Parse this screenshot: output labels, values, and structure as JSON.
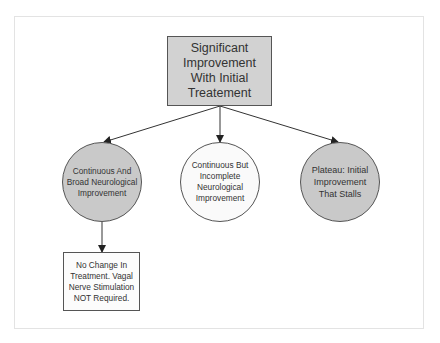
{
  "diagram": {
    "type": "flowchart",
    "root": {
      "id": "root",
      "label": "Significant Improvement With Initial Treatement",
      "shape": "rectangle",
      "fill": "#d2d2d2"
    },
    "branches": [
      {
        "id": "branch-1",
        "label": "Continuous And Broad Neurological Improvement",
        "shape": "circle",
        "fill": "#c9c9c9"
      },
      {
        "id": "branch-2",
        "label": "Continuous But Incomplete Neurological Improvement",
        "shape": "circle",
        "fill": "#fafafa"
      },
      {
        "id": "branch-3",
        "label": "Plateau: Initial Improvement That Stalls",
        "shape": "circle",
        "fill": "#c9c9c9"
      }
    ],
    "outcome": {
      "id": "outcome-1",
      "label": "No Change In Treatment. Vagal Nerve Stimulation NOT Required.",
      "shape": "rectangle",
      "fill": "#fcfcfc"
    },
    "edges": [
      {
        "from": "root",
        "to": "branch-1"
      },
      {
        "from": "root",
        "to": "branch-2"
      },
      {
        "from": "root",
        "to": "branch-3"
      },
      {
        "from": "branch-1",
        "to": "outcome-1"
      }
    ],
    "colors": {
      "stroke": "#555555",
      "text": "#333333",
      "frame": "#e3e3e3"
    }
  }
}
